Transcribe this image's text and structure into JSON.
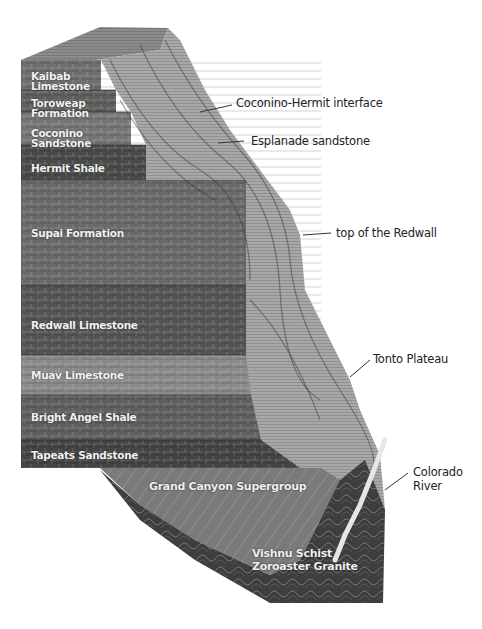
{
  "diagram": {
    "layers": [
      {
        "id": "kaibab",
        "label": "Kaibab Limestone"
      },
      {
        "id": "toroweap",
        "label": "Toroweap Formation"
      },
      {
        "id": "coconino",
        "label": "Coconino Sandstone"
      },
      {
        "id": "hermit",
        "label": "Hermit Shale"
      },
      {
        "id": "supai",
        "label": "Supai Formation"
      },
      {
        "id": "redwall",
        "label": "Redwall Limestone"
      },
      {
        "id": "muav",
        "label": "Muav Limestone"
      },
      {
        "id": "bright_angel",
        "label": "Bright Angel Shale"
      },
      {
        "id": "tapeats",
        "label": "Tapeats Sandstone"
      }
    ],
    "basement": {
      "supergroup": "Grand Canyon Supergroup",
      "vishnu": "Vishnu Schist",
      "zoroaster": "Zoroaster Granite"
    },
    "callouts": [
      {
        "id": "coconino_hermit",
        "label": "Coconino-Hermit interface"
      },
      {
        "id": "esplanade",
        "label": "Esplanade sandstone"
      },
      {
        "id": "redwall_top",
        "label": "top of the Redwall"
      },
      {
        "id": "tonto",
        "label": "Tonto Plateau"
      },
      {
        "id": "colorado",
        "label": "Colorado River"
      }
    ],
    "colors": {
      "kaibab": "#6f6f6f",
      "toroweap": "#5e5e5e",
      "coconino": "#767676",
      "hermit": "#4a4a4a",
      "supai": "#6a6a6a",
      "redwall": "#555555",
      "muav": "#8a8a8a",
      "bright_angel": "#5f5f5f",
      "tapeats": "#444444",
      "supergroup": "#7a7a7a",
      "vishnu": "#3e3e3e",
      "cliff_face": "#a8a8a8",
      "top_surface": "#8c8c8c",
      "river": "#e6e6e6"
    }
  }
}
